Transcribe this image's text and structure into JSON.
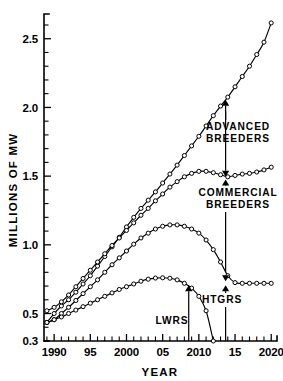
{
  "chart_data": {
    "type": "line",
    "title": "",
    "xlabel": "YEAR",
    "ylabel": "MILLIONS OF MW",
    "xlim": [
      1988.6,
      2020.8
    ],
    "ylim": [
      0.3,
      2.68
    ],
    "grid": false,
    "legend_position": "inline-annotations",
    "x_ticks_major": [
      1990,
      1995,
      2000,
      2005,
      2010,
      2015,
      2020
    ],
    "x_tick_labels": [
      "1990",
      "95",
      "2000",
      "05",
      "2010",
      "15",
      "2020"
    ],
    "x_tick_minor_step": 1,
    "y_ticks_major": [
      0.5,
      1.0,
      1.5,
      2.0,
      2.5
    ],
    "y_tick_labels": [
      "0.5",
      "1.0",
      "1.5",
      "2.0",
      "2.5"
    ],
    "y_axis_min_label": "0.3",
    "y_tick_minor_step": 0.1,
    "marker": "open-circle",
    "series": [
      {
        "name": "ADVANCED BREEDERS",
        "x": [
          1989,
          1990,
          1991,
          1992,
          1993,
          1994,
          1995,
          1996,
          1997,
          1998,
          1999,
          2000,
          2001,
          2002,
          2003,
          2004,
          2005,
          2006,
          2007,
          2008,
          2009,
          2010,
          2011,
          2012,
          2013,
          2014,
          2015,
          2016,
          2017,
          2018,
          2019,
          2020
        ],
        "values": [
          0.435,
          0.5,
          0.555,
          0.6,
          0.655,
          0.715,
          0.775,
          0.845,
          0.915,
          0.985,
          1.055,
          1.13,
          1.2,
          1.265,
          1.325,
          1.385,
          1.45,
          1.515,
          1.58,
          1.65,
          1.72,
          1.79,
          1.865,
          1.94,
          2.01,
          2.075,
          2.15,
          2.225,
          2.3,
          2.385,
          2.475,
          2.615
        ]
      },
      {
        "name": "COMMERCIAL BREEDERS",
        "x": [
          1989,
          1990,
          1991,
          1992,
          1993,
          1994,
          1995,
          1996,
          1997,
          1998,
          1999,
          2000,
          2001,
          2002,
          2003,
          2004,
          2005,
          2006,
          2007,
          2008,
          2009,
          2010,
          2011,
          2012,
          2013,
          2014,
          2015,
          2016,
          2017,
          2018,
          2019,
          2020
        ],
        "values": [
          0.52,
          0.545,
          0.585,
          0.635,
          0.695,
          0.755,
          0.815,
          0.875,
          0.935,
          0.995,
          1.05,
          1.105,
          1.16,
          1.215,
          1.265,
          1.32,
          1.37,
          1.42,
          1.46,
          1.495,
          1.52,
          1.535,
          1.535,
          1.525,
          1.51,
          1.495,
          1.505,
          1.515,
          1.52,
          1.53,
          1.545,
          1.565
        ]
      },
      {
        "name": "HTGRS",
        "x": [
          1989,
          1990,
          1991,
          1992,
          1993,
          1994,
          1995,
          1996,
          1997,
          1998,
          1999,
          2000,
          2001,
          2002,
          2003,
          2004,
          2005,
          2006,
          2007,
          2008,
          2009,
          2010,
          2011,
          2012,
          2013,
          2014,
          2015,
          2016,
          2017,
          2018,
          2019,
          2020
        ],
        "values": [
          0.435,
          0.455,
          0.5,
          0.545,
          0.595,
          0.645,
          0.695,
          0.745,
          0.8,
          0.855,
          0.905,
          0.955,
          1.005,
          1.05,
          1.085,
          1.115,
          1.135,
          1.145,
          1.145,
          1.135,
          1.115,
          1.085,
          1.035,
          0.965,
          0.875,
          0.775,
          0.725,
          0.72,
          0.72,
          0.72,
          0.72,
          0.72
        ]
      },
      {
        "name": "LWRS",
        "x": [
          1989,
          1990,
          1991,
          1992,
          1993,
          1994,
          1995,
          1996,
          1997,
          1998,
          1999,
          2000,
          2001,
          2002,
          2003,
          2004,
          2005,
          2006,
          2007,
          2008,
          2009,
          2010,
          2011,
          2012
        ],
        "values": [
          0.435,
          0.455,
          0.475,
          0.5,
          0.525,
          0.55,
          0.575,
          0.6,
          0.625,
          0.65,
          0.675,
          0.695,
          0.715,
          0.735,
          0.75,
          0.758,
          0.76,
          0.757,
          0.745,
          0.72,
          0.685,
          0.625,
          0.52,
          0.3
        ]
      }
    ],
    "annotations": [
      {
        "label_line1": "ADVANCED",
        "label_line2": "BREEDERS",
        "target_x": 2013.7,
        "target_y": 2.055,
        "arrow": "up"
      },
      {
        "label_line1": "COMMERCIAL",
        "label_line2": "BREEDERS",
        "target_x": 2013.7,
        "target_y": 1.495,
        "arrow": "up-down"
      },
      {
        "label_line1": "HTGRS",
        "label_line2": "",
        "target_x": 2013.7,
        "target_y": 0.735,
        "arrow": "up-down"
      },
      {
        "label_line1": "LWRS",
        "label_line2": "",
        "target_x": 2008.6,
        "target_y": 0.705,
        "arrow": "up"
      }
    ]
  }
}
